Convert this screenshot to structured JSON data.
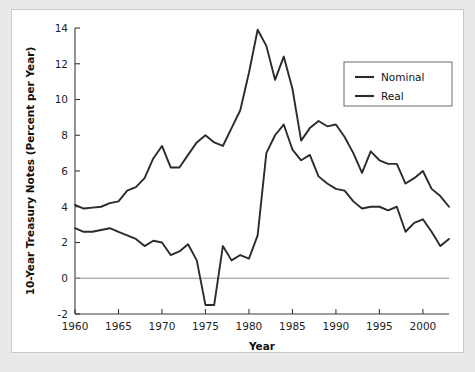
{
  "chart_data": {
    "type": "line",
    "title": "",
    "xlabel": "Year",
    "ylabel": "10-Year Treasury Notes (Percent per Year)",
    "xlim": [
      1960,
      2003
    ],
    "ylim": [
      -2,
      14
    ],
    "xticks": [
      1960,
      1965,
      1970,
      1975,
      1980,
      1985,
      1990,
      1995,
      2000
    ],
    "yticks": [
      -2,
      0,
      2,
      4,
      6,
      8,
      10,
      12,
      14
    ],
    "grid": false,
    "zero_reference_line": 0,
    "legend_position": "top-right",
    "legend": [
      "Nominal",
      "Real"
    ],
    "x": [
      1960,
      1961,
      1962,
      1963,
      1964,
      1965,
      1966,
      1967,
      1968,
      1969,
      1970,
      1971,
      1972,
      1973,
      1974,
      1975,
      1976,
      1977,
      1978,
      1979,
      1980,
      1981,
      1982,
      1983,
      1984,
      1985,
      1986,
      1987,
      1988,
      1989,
      1990,
      1991,
      1992,
      1993,
      1994,
      1995,
      1996,
      1997,
      1998,
      1999,
      2000,
      2001,
      2002,
      2003
    ],
    "series": [
      {
        "name": "Nominal",
        "color": "#2b2b2b",
        "values": [
          4.1,
          3.9,
          3.95,
          4.0,
          4.2,
          4.3,
          4.9,
          5.1,
          5.6,
          6.7,
          7.4,
          6.2,
          6.2,
          6.9,
          7.6,
          8.0,
          7.6,
          7.4,
          8.4,
          9.4,
          11.5,
          13.9,
          13.0,
          11.1,
          12.4,
          10.6,
          7.7,
          8.4,
          8.8,
          8.5,
          8.6,
          7.9,
          7.0,
          5.9,
          7.1,
          6.6,
          6.4,
          6.4,
          5.3,
          5.6,
          6.0,
          5.0,
          4.6,
          4.0
        ]
      },
      {
        "name": "Real",
        "color": "#2b2b2b",
        "values": [
          2.8,
          2.6,
          2.6,
          2.7,
          2.8,
          2.6,
          2.4,
          2.2,
          1.8,
          2.1,
          2.0,
          1.3,
          1.5,
          1.9,
          1.0,
          -1.5,
          -1.5,
          1.8,
          1.0,
          1.3,
          1.1,
          2.4,
          7.0,
          8.0,
          8.6,
          7.2,
          6.6,
          6.9,
          5.7,
          5.3,
          5.0,
          4.9,
          4.3,
          3.9,
          4.0,
          4.0,
          3.8,
          4.0,
          2.6,
          3.1,
          3.3,
          2.6,
          1.8,
          2.2
        ]
      }
    ]
  },
  "legend": {
    "items": [
      {
        "label": "Nominal"
      },
      {
        "label": "Real"
      }
    ]
  },
  "axes": {
    "x_title": "Year",
    "y_title": "10-Year Treasury Notes (Percent per Year)",
    "x_tick_labels": [
      "1960",
      "1965",
      "1970",
      "1975",
      "1980",
      "1985",
      "1990",
      "1995",
      "2000"
    ],
    "y_tick_labels": [
      "14",
      "12",
      "10",
      "8",
      "6",
      "4",
      "2",
      "0",
      "-2"
    ]
  }
}
